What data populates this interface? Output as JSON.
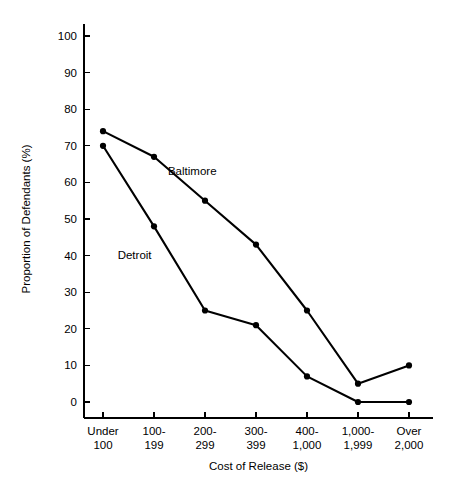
{
  "chart_data": {
    "type": "line",
    "title": "",
    "xlabel": "Cost of Release ($)",
    "ylabel": "Proportion of Defendants (%)",
    "categories": [
      "Under\n100",
      "100-\n199",
      "200-\n299",
      "300-\n399",
      "400-\n1,000",
      "1,000-\n1,999",
      "Over\n2,000"
    ],
    "category_lines": [
      [
        "Under",
        "100"
      ],
      [
        "100-",
        "199"
      ],
      [
        "200-",
        "299"
      ],
      [
        "300-",
        "399"
      ],
      [
        "400-",
        "1,000"
      ],
      [
        "1,000-",
        "1,999"
      ],
      [
        "Over",
        "2,000"
      ]
    ],
    "yticks": [
      0,
      10,
      20,
      30,
      40,
      50,
      60,
      70,
      80,
      90,
      100
    ],
    "ytick_labels": [
      "0",
      "10",
      "20",
      "30",
      "40",
      "50",
      "60",
      "70",
      "80",
      "90",
      "100"
    ],
    "ylim": [
      0,
      100
    ],
    "grid": false,
    "legend_position": "inline-annotation",
    "series": [
      {
        "name": "Baltimore",
        "label": "Baltimore",
        "color": "#000000",
        "values": [
          74,
          67,
          55,
          43,
          25,
          5,
          10
        ],
        "annotation": {
          "text": "Baltimore",
          "x_category_index": 1.75,
          "y_value": 62
        }
      },
      {
        "name": "Detroit",
        "label": "Detroit",
        "color": "#000000",
        "values": [
          70,
          48,
          25,
          21,
          7,
          0,
          0
        ],
        "annotation": {
          "text": "Detroit",
          "x_category_index": 0.62,
          "y_value": 39
        }
      }
    ]
  },
  "figure": {
    "background_color": "#ffffff",
    "foreground_color": "#000000"
  }
}
